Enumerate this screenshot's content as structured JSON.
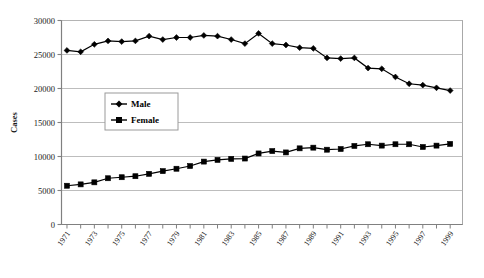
{
  "chart_data": {
    "type": "line",
    "title": "",
    "xlabel": "",
    "ylabel": "Cases",
    "ylim": [
      0,
      30000
    ],
    "ytick_labels": [
      "0",
      "5000",
      "10000",
      "15000",
      "20000",
      "25000",
      "30000"
    ],
    "ytick_values": [
      0,
      5000,
      10000,
      15000,
      20000,
      25000,
      30000
    ],
    "grid": true,
    "legend_position": "upper-left-inside",
    "x": [
      1971,
      1972,
      1973,
      1974,
      1975,
      1976,
      1977,
      1978,
      1979,
      1980,
      1981,
      1982,
      1983,
      1984,
      1985,
      1986,
      1987,
      1988,
      1989,
      1990,
      1991,
      1992,
      1993,
      1994,
      1995,
      1996,
      1997,
      1998,
      1999
    ],
    "xtick_labels": [
      "1971",
      "1973",
      "1975",
      "1977",
      "1979",
      "1981",
      "1983",
      "1985",
      "1987",
      "1989",
      "1991",
      "1993",
      "1995",
      "1997",
      "1999"
    ],
    "xtick_values": [
      1971,
      1973,
      1975,
      1977,
      1979,
      1981,
      1983,
      1985,
      1987,
      1989,
      1991,
      1993,
      1995,
      1997,
      1999
    ],
    "series": [
      {
        "name": "Male",
        "marker": "diamond",
        "color": "#000000",
        "values": [
          25600,
          25400,
          26500,
          27000,
          26900,
          27000,
          27700,
          27200,
          27500,
          27500,
          27800,
          27700,
          27200,
          26600,
          28100,
          26600,
          26400,
          26000,
          25900,
          24500,
          24400,
          24500,
          23000,
          22900,
          21700,
          20700,
          20500,
          20100,
          19700
        ]
      },
      {
        "name": "Female",
        "marker": "square",
        "color": "#000000",
        "values": [
          5700,
          5900,
          6200,
          6800,
          6950,
          7100,
          7450,
          7850,
          8200,
          8600,
          9250,
          9500,
          9650,
          9700,
          10450,
          10800,
          10600,
          11200,
          11300,
          11000,
          11100,
          11550,
          11800,
          11600,
          11800,
          11800,
          11400,
          11600,
          11850
        ]
      }
    ]
  },
  "legend": {
    "entries": [
      {
        "label": "Male"
      },
      {
        "label": "Female"
      }
    ]
  }
}
